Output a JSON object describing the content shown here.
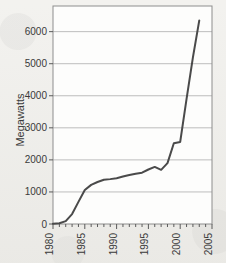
{
  "chart_data": {
    "type": "line",
    "title": "",
    "xlabel": "",
    "ylabel": "Megawatts",
    "xlim": [
      1980,
      2005
    ],
    "ylim": [
      0,
      6800
    ],
    "grid": true,
    "legend": false,
    "y_ticks": [
      0,
      1000,
      2000,
      3000,
      4000,
      5000,
      6000
    ],
    "y_tick_labels": [
      "0",
      "1000",
      "2000",
      "3000",
      "4000",
      "5000",
      "6000"
    ],
    "x_ticks": [
      1980,
      1985,
      1990,
      1995,
      2000,
      2005
    ],
    "x_tick_labels": [
      "1980",
      "1985",
      "1990",
      "1995",
      "2000",
      "2005"
    ],
    "x_minor_tick_step": 1,
    "line_color": "#4a4a4a",
    "line_width": 2,
    "x": [
      1980,
      1981,
      1982,
      1983,
      1984,
      1985,
      1986,
      1987,
      1988,
      1989,
      1990,
      1991,
      1992,
      1993,
      1994,
      1995,
      1996,
      1997,
      1998,
      1999,
      2000,
      2001,
      2002,
      2003
    ],
    "values": [
      10,
      25,
      90,
      310,
      690,
      1060,
      1220,
      1310,
      1380,
      1400,
      1430,
      1480,
      1530,
      1570,
      1600,
      1700,
      1780,
      1690,
      1900,
      2520,
      2560,
      3900,
      5200,
      6350
    ],
    "series": [
      {
        "name": "Installed capacity",
        "values": [
          10,
          25,
          90,
          310,
          690,
          1060,
          1220,
          1310,
          1380,
          1400,
          1430,
          1480,
          1530,
          1570,
          1600,
          1700,
          1780,
          1690,
          1900,
          2520,
          2560,
          3900,
          5200,
          6350
        ]
      }
    ]
  }
}
